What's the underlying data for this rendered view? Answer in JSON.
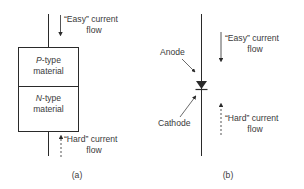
{
  "figure": {
    "panel_a": {
      "caption": "(a)",
      "easy_label_line1": "“Easy” current",
      "easy_label_line2": "flow",
      "hard_label_line1": "“Hard” current",
      "hard_label_line2": "flow",
      "p_region_letter": "P",
      "p_region_rest": "-type",
      "p_region_line2": "material",
      "n_region_letter": "N",
      "n_region_rest": "-type",
      "n_region_line2": "material"
    },
    "panel_b": {
      "caption": "(b)",
      "anode_label": "Anode",
      "cathode_label": "Cathode",
      "easy_label_line1": "“Easy” current",
      "easy_label_line2": "flow",
      "hard_label_line1": "“Hard” current",
      "hard_label_line2": "flow"
    },
    "colors": {
      "line": "#2a2a2a",
      "text": "#3a3a3a",
      "background": "#ffffff"
    }
  }
}
